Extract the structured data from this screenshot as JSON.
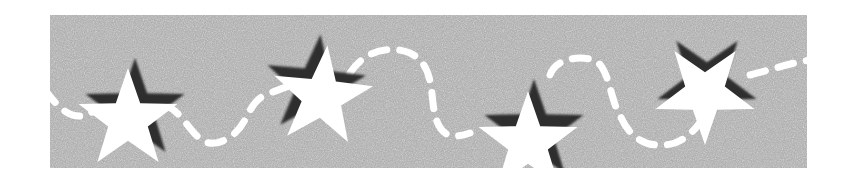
{
  "graphic": {
    "description": "Gray textured banner with white stars and a white dashed wavy line",
    "background_color": "#a9a9a9",
    "star_color": "#ffffff",
    "shadow_color": "#2e2e2e",
    "dash_color": "#ffffff",
    "stars": [
      {
        "cx": 78,
        "cy": 105,
        "r": 52,
        "rotation": 0
      },
      {
        "cx": 272,
        "cy": 82,
        "r": 52,
        "rotation": 6
      },
      {
        "cx": 478,
        "cy": 128,
        "r": 52,
        "rotation": 0
      },
      {
        "cx": 660,
        "cy": 80,
        "r": 52,
        "rotation": -8
      }
    ]
  }
}
